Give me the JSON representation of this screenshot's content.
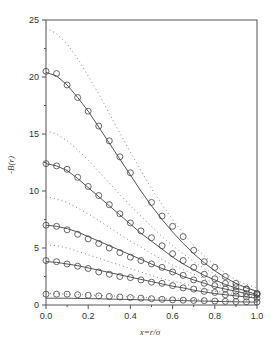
{
  "chart_data": {
    "type": "line",
    "title": "",
    "xlabel": "x=r/σ",
    "ylabel": "-B(r)",
    "xlim": [
      0.0,
      1.0
    ],
    "ylim": [
      0,
      25
    ],
    "xticks": [
      "0.0",
      "0.2",
      "0.4",
      "0.6",
      "0.8",
      "1.0"
    ],
    "yticks": [
      "0",
      "5",
      "10",
      "15",
      "20",
      "25"
    ],
    "grid": false,
    "legend": null,
    "x": [
      0.0,
      0.05,
      0.1,
      0.15,
      0.2,
      0.25,
      0.3,
      0.35,
      0.4,
      0.45,
      0.5,
      0.55,
      0.6,
      0.65,
      0.7,
      0.75,
      0.8,
      0.85,
      0.9,
      0.95,
      1.0
    ],
    "series": [
      {
        "name": "solid-1",
        "style": "solid",
        "values": [
          20.4,
          20.1,
          19.3,
          18.2,
          17.0,
          15.6,
          14.2,
          12.8,
          11.4,
          10.0,
          8.7,
          7.5,
          6.4,
          5.4,
          4.5,
          3.7,
          3.0,
          2.4,
          1.9,
          1.5,
          1.2
        ]
      },
      {
        "name": "markers-1",
        "style": "circle",
        "values": [
          20.5,
          20.3,
          19.3,
          18.2,
          17.0,
          15.7,
          14.4,
          13.0,
          11.6,
          null,
          9.0,
          7.8,
          6.9,
          6.0,
          4.8,
          3.8,
          3.3,
          2.5,
          1.9,
          1.4,
          1.0
        ]
      },
      {
        "name": "dotted-1",
        "style": "dotted",
        "values": [
          24.3,
          23.8,
          22.9,
          21.6,
          20.1,
          18.5,
          16.8,
          15.1,
          13.4,
          11.8,
          10.2,
          8.8,
          7.5,
          6.3,
          5.2,
          4.3,
          3.5,
          2.8,
          2.2,
          1.8,
          1.5
        ]
      },
      {
        "name": "solid-2",
        "style": "solid",
        "values": [
          12.4,
          12.2,
          11.8,
          11.1,
          10.3,
          9.5,
          8.7,
          7.9,
          7.1,
          6.3,
          5.6,
          4.9,
          4.2,
          3.6,
          3.1,
          2.6,
          2.2,
          1.8,
          1.5,
          1.2,
          0.9
        ]
      },
      {
        "name": "markers-2",
        "style": "circle",
        "values": [
          12.4,
          12.2,
          11.9,
          11.2,
          10.4,
          9.6,
          8.8,
          8.0,
          7.2,
          6.5,
          5.9,
          5.2,
          4.5,
          3.9,
          3.3,
          2.7,
          2.3,
          1.9,
          1.6,
          1.4,
          1.0
        ]
      },
      {
        "name": "dotted-2",
        "style": "dotted",
        "values": [
          15.3,
          15.0,
          14.4,
          13.6,
          12.7,
          11.7,
          10.7,
          9.7,
          8.7,
          7.8,
          6.9,
          6.0,
          5.2,
          4.5,
          3.8,
          3.2,
          2.7,
          2.2,
          1.8,
          1.5,
          1.2
        ]
      },
      {
        "name": "solid-3",
        "style": "solid",
        "values": [
          7.0,
          6.9,
          6.7,
          6.4,
          6.0,
          5.6,
          5.2,
          4.8,
          4.4,
          4.0,
          3.6,
          3.2,
          2.9,
          2.5,
          2.2,
          1.9,
          1.6,
          1.4,
          1.2,
          1.0,
          0.8
        ]
      },
      {
        "name": "markers-3",
        "style": "circle",
        "values": [
          7.0,
          6.9,
          6.6,
          6.2,
          5.8,
          5.4,
          5.0,
          4.6,
          4.2,
          3.9,
          3.6,
          3.3,
          2.9,
          2.6,
          2.2,
          1.9,
          1.7,
          1.4,
          1.2,
          1.0,
          0.9
        ]
      },
      {
        "name": "dotted-3",
        "style": "dotted",
        "values": [
          9.5,
          9.3,
          9.0,
          8.5,
          8.0,
          7.4,
          6.8,
          6.2,
          5.6,
          5.1,
          4.5,
          4.0,
          3.5,
          3.1,
          2.7,
          2.3,
          1.9,
          1.6,
          1.4,
          1.2,
          1.0
        ]
      },
      {
        "name": "solid-4",
        "style": "solid",
        "values": [
          3.8,
          3.75,
          3.6,
          3.45,
          3.25,
          3.05,
          2.85,
          2.65,
          2.45,
          2.25,
          2.05,
          1.85,
          1.65,
          1.5,
          1.3,
          1.15,
          1.0,
          0.9,
          0.8,
          0.7,
          0.6
        ]
      },
      {
        "name": "markers-4",
        "style": "circle",
        "values": [
          3.9,
          3.8,
          3.6,
          3.4,
          3.2,
          2.9,
          2.7,
          2.5,
          2.4,
          2.2,
          2.0,
          1.9,
          1.7,
          1.5,
          1.4,
          1.2,
          1.1,
          0.9,
          0.8,
          0.7,
          0.6
        ]
      },
      {
        "name": "dotted-4",
        "style": "dotted",
        "values": [
          5.3,
          5.2,
          5.0,
          4.7,
          4.4,
          4.1,
          3.8,
          3.5,
          3.2,
          2.9,
          2.6,
          2.3,
          2.1,
          1.9,
          1.6,
          1.4,
          1.2,
          1.1,
          0.9,
          0.8,
          0.7
        ]
      },
      {
        "name": "solid-5",
        "style": "solid",
        "values": [
          0.6,
          0.6,
          0.6,
          0.58,
          0.56,
          0.54,
          0.52,
          0.5,
          0.48,
          0.46,
          0.44,
          0.42,
          0.4,
          0.38,
          0.36,
          0.34,
          0.32,
          0.3,
          0.28,
          0.26,
          0.25
        ]
      },
      {
        "name": "markers-5",
        "style": "circle",
        "values": [
          0.95,
          0.95,
          0.95,
          0.9,
          0.85,
          0.8,
          0.75,
          0.7,
          0.65,
          0.6,
          0.55,
          0.5,
          0.45,
          0.42,
          0.4,
          0.38,
          0.35,
          0.32,
          0.3,
          0.28,
          0.26
        ]
      },
      {
        "name": "dotted-5",
        "style": "dotted",
        "values": [
          1.0,
          1.0,
          0.95,
          0.92,
          0.88,
          0.84,
          0.8,
          0.76,
          0.72,
          0.68,
          0.64,
          0.6,
          0.56,
          0.52,
          0.48,
          0.44,
          0.4,
          0.37,
          0.34,
          0.31,
          0.28
        ]
      }
    ]
  },
  "plot_frame": {
    "left": 46,
    "top": 20,
    "right": 257,
    "bottom": 305
  },
  "colors": {
    "axis": "#555555",
    "line": "#444444",
    "dotted": "#888888",
    "marker": "#444444"
  }
}
